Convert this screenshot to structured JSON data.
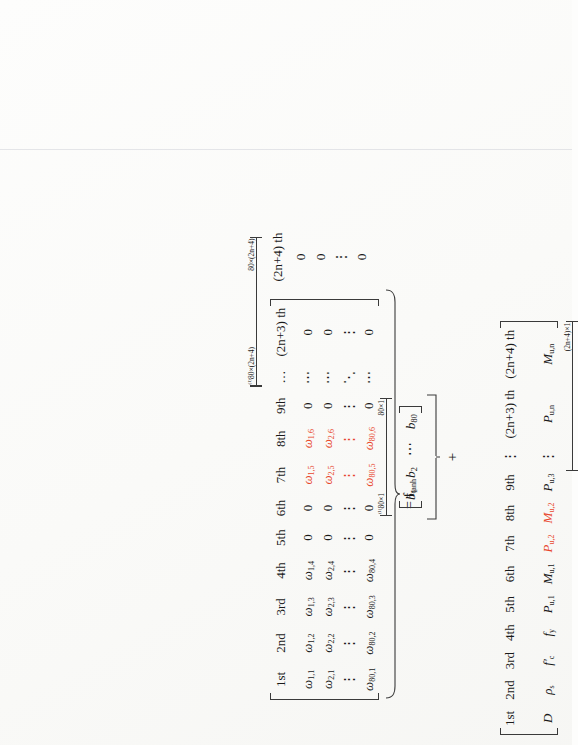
{
  "figure": {
    "kind": "rotated-equation-scan",
    "rotation": "90deg counter-clockwise",
    "accent_color": "#e8462c",
    "ink_color": "#1a1a1a"
  },
  "equation": {
    "lhs_label": "= f",
    "lhs_label_sub": "tanh",
    "plus_sign": "+"
  },
  "weight_matrix": {
    "name": "omega-weight-matrix",
    "dim_label_top": "80×(2n+4)",
    "dim_label_top_super": "(1)",
    "dim_label_bottom": "80×(2n+4)",
    "columns": [
      "1st",
      "2nd",
      "3rd",
      "4th",
      "5th",
      "6th",
      "7th",
      "8th",
      "9th",
      "…",
      "(2n+3) th",
      "(2n+4) th"
    ],
    "column_colors": [
      "ink",
      "ink",
      "ink",
      "ink",
      "ink",
      "ink",
      "red",
      "red",
      "ink",
      "ink",
      "ink",
      "ink"
    ],
    "rows": [
      [
        "ω",
        "1,1",
        "1,2",
        "1,3",
        "1,4",
        "0",
        "0",
        "1,5",
        "1,6",
        "0",
        "…",
        "0",
        "0"
      ],
      [
        "ω",
        "2,1",
        "2,2",
        "2,3",
        "2,4",
        "0",
        "0",
        "2,5",
        "2,6",
        "0",
        "…",
        "0",
        "0"
      ],
      [
        "vdots",
        "⋮",
        "⋮",
        "⋮",
        "⋮",
        "⋮",
        "⋮",
        "⋮",
        "⋮",
        "⋮",
        "⋱",
        "⋮",
        "⋮"
      ],
      [
        "ω",
        "80,1",
        "80,2",
        "80,3",
        "80,4",
        "0",
        "0",
        "80,5",
        "80,6",
        "0",
        "…",
        "0",
        "0"
      ]
    ],
    "symbol": "ω",
    "zero": "0",
    "hdots": "⋯",
    "vdots": "⋮",
    "ddots": "⋱"
  },
  "bias_vector": {
    "name": "bias-vector-b",
    "dim_label_top": "80×1",
    "dim_label_top_super": "(1)",
    "dim_label_bottom": "80×1",
    "entries": [
      "b",
      "1",
      "2",
      "80"
    ],
    "symbol": "b",
    "hdots": "⋯"
  },
  "input_vector": {
    "name": "input-feature-vector",
    "dim_label": "(2n+4)×1",
    "ordinals": [
      "1st",
      "2nd",
      "3rd",
      "4th",
      "5th",
      "6th",
      "7th",
      "8th",
      "9th",
      "⋮",
      "(2n+3) th",
      "(2n+4) th"
    ],
    "variables": [
      {
        "base": "D",
        "sub": "",
        "color": "ink"
      },
      {
        "base": "ρ",
        "sub": "s",
        "color": "ink"
      },
      {
        "base": "f′",
        "sub": "c",
        "color": "ink"
      },
      {
        "base": "f",
        "sub": "y",
        "color": "ink"
      },
      {
        "base": "P",
        "sub": "u,1",
        "color": "ink"
      },
      {
        "base": "M",
        "sub": "u,1",
        "color": "ink"
      },
      {
        "base": "P",
        "sub": "u,2",
        "color": "red"
      },
      {
        "base": "M",
        "sub": "u,2",
        "color": "red"
      },
      {
        "base": "P",
        "sub": "u,3",
        "color": "ink"
      },
      {
        "base": "⋮",
        "sub": "",
        "color": "ink"
      },
      {
        "base": "P",
        "sub": "u,n",
        "color": "ink"
      },
      {
        "base": "M",
        "sub": "u,n",
        "color": "ink"
      }
    ]
  }
}
